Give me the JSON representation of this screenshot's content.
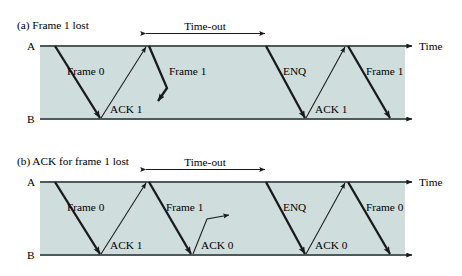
{
  "figure": {
    "kind": "protocol-timing-diagram",
    "fill_color": "#cfdddd",
    "line_color": "#1a1a1a",
    "panels": [
      {
        "id": "a",
        "caption": "(a) Frame 1 lost",
        "axis_top_label": "A",
        "axis_bottom_label": "B",
        "time_axis_label": "Time",
        "timeout_label": "Time-out",
        "messages": [
          {
            "label": "Frame 0",
            "direction": "a-to-b",
            "lost": false
          },
          {
            "label": "ACK 1",
            "direction": "b-to-a",
            "lost": false
          },
          {
            "label": "Frame 1",
            "direction": "a-to-b",
            "lost": true
          },
          {
            "label": "ENQ",
            "direction": "a-to-b",
            "lost": false
          },
          {
            "label": "ACK 1",
            "direction": "b-to-a",
            "lost": false
          },
          {
            "label": "Frame 1",
            "direction": "a-to-b",
            "lost": false
          }
        ]
      },
      {
        "id": "b",
        "caption": "(b) ACK for frame 1 lost",
        "axis_top_label": "A",
        "axis_bottom_label": "B",
        "time_axis_label": "Time",
        "timeout_label": "Time-out",
        "messages": [
          {
            "label": "Frame 0",
            "direction": "a-to-b",
            "lost": false
          },
          {
            "label": "ACK 1",
            "direction": "b-to-a",
            "lost": false
          },
          {
            "label": "Frame 1",
            "direction": "a-to-b",
            "lost": false
          },
          {
            "label": "ACK 0",
            "direction": "b-to-a",
            "lost": true
          },
          {
            "label": "ENQ",
            "direction": "a-to-b",
            "lost": false
          },
          {
            "label": "ACK 0",
            "direction": "b-to-a",
            "lost": false
          },
          {
            "label": "Frame 0",
            "direction": "a-to-b",
            "lost": false
          }
        ]
      }
    ]
  }
}
